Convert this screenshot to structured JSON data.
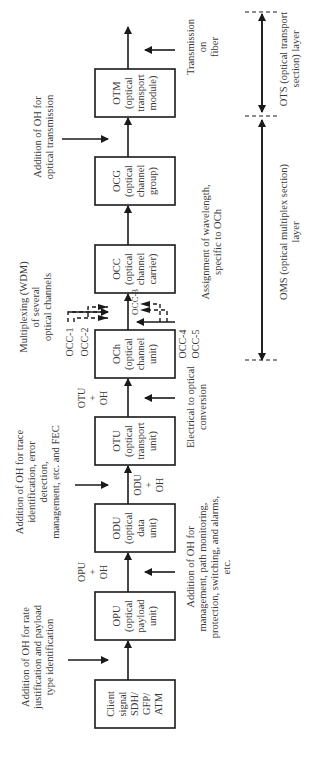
{
  "boxes": [
    {
      "id": "client",
      "lines": [
        "Client",
        "signal",
        "SDH/",
        "GFP/",
        "ATM"
      ]
    },
    {
      "id": "opu",
      "lines": [
        "OPU",
        "(optical",
        "payload",
        "unit)"
      ]
    },
    {
      "id": "odu",
      "lines": [
        "ODU",
        "(optical",
        "data",
        "unit)"
      ]
    },
    {
      "id": "otu",
      "lines": [
        "OTU",
        "(optical",
        "transport",
        "unit)"
      ]
    },
    {
      "id": "och",
      "lines": [
        "OCh",
        "(optical",
        "channel",
        "unit)"
      ]
    },
    {
      "id": "occ",
      "lines": [
        "OCC",
        "(optical",
        "channel",
        "carrier)"
      ]
    },
    {
      "id": "ocg",
      "lines": [
        "OCG",
        "(optical",
        "channel",
        "group)"
      ]
    },
    {
      "id": "otm",
      "lines": [
        "OTM",
        "(optical",
        "transport",
        "module)"
      ]
    }
  ],
  "link_labels": {
    "opu_oh": [
      "OPU",
      "+",
      "OH"
    ],
    "odu_oh": [
      "ODU",
      "+",
      "OH"
    ],
    "otu_oh": [
      "OTU",
      "+",
      "OH"
    ]
  },
  "occ_labels": {
    "occ1": "OCC-1",
    "occ2": "OCC-2",
    "occ3": "OCC-3",
    "occ4": "OCC-4",
    "occ5": "OCC-5"
  },
  "annotations": {
    "rate_justification": [
      "Addition of OH for rate",
      "justification and payload",
      "type identification"
    ],
    "trace_identification": [
      "Addition of OH for trace",
      "identification, error",
      "detection,",
      "management, etc. and FEC"
    ],
    "wdm_multiplexing": [
      "Multiplexing (WDM)",
      "of several",
      "optical channels"
    ],
    "optical_transmission": [
      "Addition of OH for",
      "optical transmission"
    ],
    "path_monitoring": [
      "Addition of OH for",
      "management, path monitoring,",
      "protection, switching, and alarms,",
      "etc."
    ],
    "electrical_to_optical": [
      "Electrical to optical",
      "conversion"
    ],
    "wavelength_assignment": [
      "Assignment of wavelength,",
      "specific to OCh"
    ],
    "transmission_on_fiber": [
      "Transmission",
      "on",
      "fiber"
    ]
  },
  "layers": {
    "oms": [
      "OMS (optical multiplex section)",
      "layer"
    ],
    "ots": [
      "OTS (optical transport",
      "section) layer"
    ]
  },
  "colors": {
    "line": "#1a1a1a",
    "text": "#3a3a3a",
    "background": "#ffffff"
  }
}
